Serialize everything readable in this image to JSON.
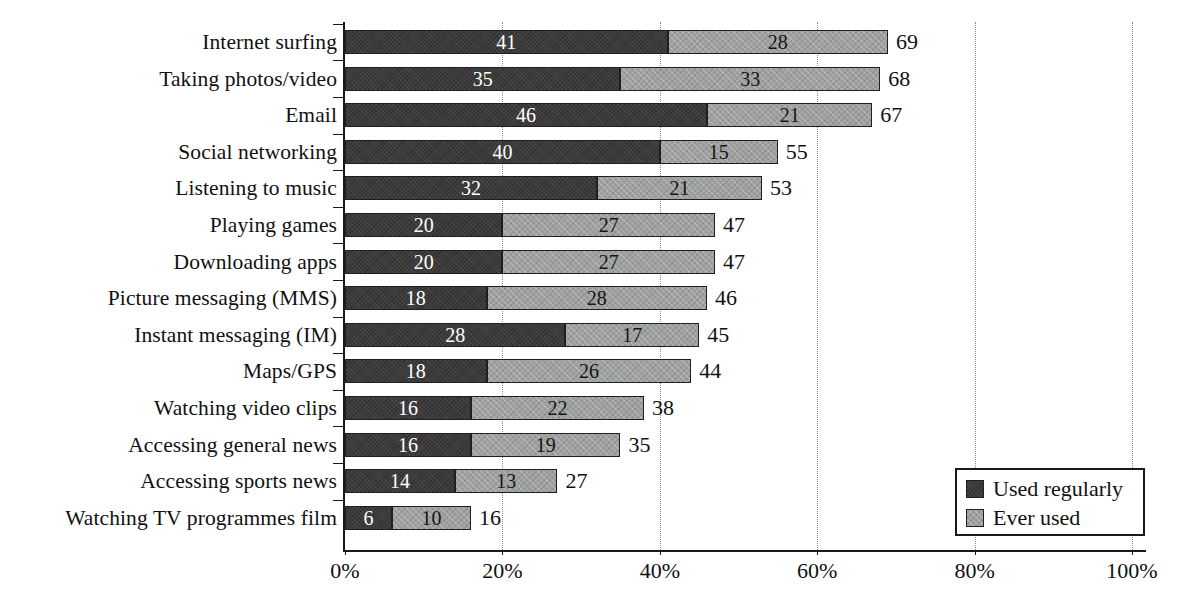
{
  "chart_data": {
    "type": "bar",
    "orientation": "horizontal",
    "stacked": true,
    "title": "",
    "subtitle": "",
    "xlabel": "",
    "ylabel": "",
    "xlim": [
      0,
      100
    ],
    "xticks": [
      0,
      20,
      40,
      60,
      80,
      100
    ],
    "xtick_labels": [
      "0%",
      "20%",
      "40%",
      "60%",
      "80%",
      "100%"
    ],
    "grid": "vertical-dotted",
    "legend_position": "bottom-right",
    "categories": [
      "Internet surfing",
      "Taking photos/video",
      "Email",
      "Social networking",
      "Listening to music",
      "Playing games",
      "Downloading apps",
      "Picture messaging (MMS)",
      "Instant messaging (IM)",
      "Maps/GPS",
      "Watching video clips",
      "Accessing general news",
      "Accessing sports news",
      "Watching TV programmes film"
    ],
    "series": [
      {
        "name": "Used regularly",
        "color": "#3b3b3b",
        "values": [
          41,
          35,
          46,
          40,
          32,
          20,
          20,
          18,
          28,
          18,
          16,
          16,
          14,
          6
        ]
      },
      {
        "name": "Ever used",
        "color": "#9fa0a0",
        "values": [
          28,
          33,
          21,
          15,
          21,
          27,
          27,
          28,
          17,
          26,
          22,
          19,
          13,
          10
        ]
      }
    ],
    "totals": [
      69,
      68,
      67,
      55,
      53,
      47,
      47,
      46,
      45,
      44,
      38,
      35,
      27,
      16
    ]
  },
  "legend": {
    "items": [
      {
        "label": "Used regularly",
        "color": "#3b3b3b"
      },
      {
        "label": "Ever used",
        "color": "#9fa0a0"
      }
    ]
  },
  "colors": {
    "used_regularly": "#3b3b3b",
    "ever_used": "#9fa0a0",
    "axis": "#1a1a1a",
    "gridline": "#8c8c8c",
    "background": "#ffffff",
    "text": "#111111"
  }
}
